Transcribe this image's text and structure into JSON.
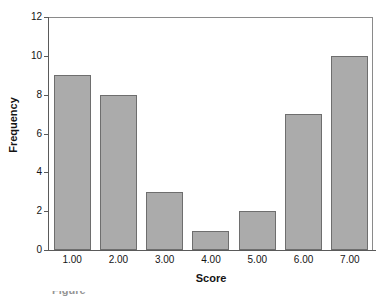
{
  "chart_data": {
    "type": "bar",
    "title": "",
    "subtitle": "",
    "xlabel": "Score",
    "ylabel": "Frequency",
    "categories": [
      "1.00",
      "2.00",
      "3.00",
      "4.00",
      "5.00",
      "6.00",
      "7.00"
    ],
    "values": [
      9,
      8,
      3,
      1,
      2,
      7,
      10
    ],
    "ylim": [
      0,
      12
    ],
    "y_ticks": [
      0,
      2,
      4,
      6,
      8,
      10,
      12
    ],
    "y_tick_labels": [
      "0",
      "2",
      "4",
      "6",
      "8",
      "10",
      "12"
    ],
    "x_tick_labels": [
      "1.00",
      "2.00",
      "3.00",
      "4.00",
      "5.00",
      "6.00",
      "7.00"
    ],
    "grid": false,
    "legend": null,
    "legend_position": "none",
    "bar_color": "#ababab",
    "bar_border_color": "#6e6e6e",
    "axis_color": "#5a5a5a",
    "frame_color": "#8a8a8a",
    "text_color": "#141414",
    "background": "#ffffff",
    "annotations": []
  },
  "footer": {
    "caption_fragment": "Figure"
  }
}
